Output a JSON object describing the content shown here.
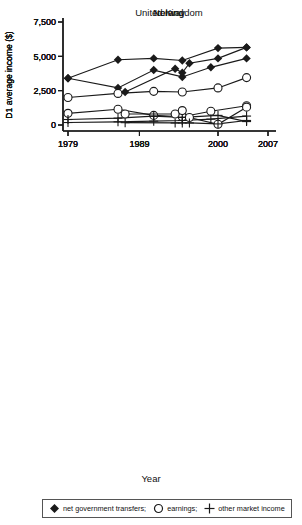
{
  "page": {
    "background": "#ffffff",
    "line_color": "#1a1a1a",
    "text_color": "#000000"
  },
  "ylabel": "D1 average income ($)",
  "xlabel": "Year",
  "axes": {
    "y_ticks": [
      "0",
      "2,500",
      "5,000",
      "7,500"
    ],
    "y_tick_values": [
      0,
      2500,
      5000,
      7500
    ],
    "x_ticks": [
      "1979",
      "1989",
      "2000",
      "2007"
    ],
    "x_tick_values": [
      1979,
      1989,
      2000,
      2007
    ],
    "xlim": [
      1979,
      2007
    ],
    "ylim": [
      0,
      7500
    ],
    "grid": false
  },
  "legend": {
    "position": "bottom",
    "items": [
      {
        "marker": "diamond",
        "label": "net government transfers;"
      },
      {
        "marker": "circle",
        "label": "earnings;"
      },
      {
        "marker": "plus",
        "label": "other market income"
      }
    ]
  },
  "chart_data": [
    {
      "type": "line",
      "title": "United Kingdom",
      "xlabel": "",
      "ylabel": "D1 average income ($)",
      "xlim": [
        1979,
        2007
      ],
      "ylim": [
        0,
        7500
      ],
      "x": [
        1979,
        1986,
        1991,
        1995,
        1999,
        2004
      ],
      "series": [
        {
          "name": "net government transfers",
          "marker": "diamond",
          "values": [
            3400,
            2700,
            4000,
            3500,
            4200,
            4850
          ]
        },
        {
          "name": "earnings",
          "marker": "circle",
          "values": [
            850,
            1150,
            700,
            600,
            1000,
            1400
          ]
        },
        {
          "name": "other market income",
          "marker": "plus",
          "values": [
            180,
            230,
            280,
            330,
            430,
            650
          ]
        }
      ]
    },
    {
      "type": "line",
      "title": "Norway",
      "xlabel": "",
      "ylabel": "D1 average income ($)",
      "xlim": [
        1979,
        2007
      ],
      "ylim": [
        0,
        7500
      ],
      "x": [
        1979,
        1986,
        1991,
        1995,
        2000,
        2004
      ],
      "series": [
        {
          "name": "net government transfers",
          "marker": "diamond",
          "values": [
            3400,
            4750,
            4850,
            4700,
            5600,
            5650
          ]
        },
        {
          "name": "earnings",
          "marker": "circle",
          "values": [
            2000,
            2300,
            2450,
            2400,
            2700,
            3450
          ]
        },
        {
          "name": "other market income",
          "marker": "plus",
          "values": [
            400,
            500,
            650,
            550,
            700,
            250
          ]
        }
      ]
    },
    {
      "type": "line",
      "title": "Ireland",
      "xlabel": "Year",
      "ylabel": "D1 average income ($)",
      "xlim": [
        1979,
        2007
      ],
      "ylim": [
        0,
        7500
      ],
      "x": [
        1987,
        1994,
        1995,
        1996,
        2000,
        2004
      ],
      "series": [
        {
          "name": "net government transfers",
          "marker": "diamond",
          "values": [
            2400,
            4100,
            3800,
            4500,
            4850,
            5650
          ]
        },
        {
          "name": "earnings",
          "marker": "circle",
          "values": [
            800,
            800,
            1050,
            550,
            50,
            1300
          ]
        },
        {
          "name": "other market income",
          "marker": "plus",
          "values": [
            170,
            150,
            150,
            150,
            80,
            330
          ]
        }
      ]
    }
  ]
}
